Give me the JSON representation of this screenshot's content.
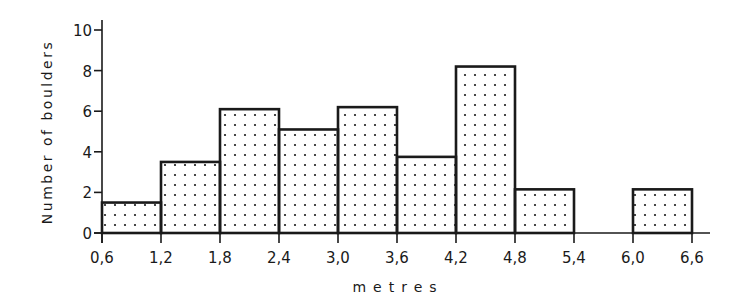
{
  "chart_data": {
    "type": "bar",
    "subtype": "histogram",
    "title": "",
    "xlabel": "metres",
    "ylabel": "Number of boulders",
    "bin_edges": [
      0.6,
      1.2,
      1.8,
      2.4,
      3.0,
      3.6,
      4.2,
      4.8,
      5.4,
      6.0,
      6.6
    ],
    "categories": [
      "0,6–1,2",
      "1,2–1,8",
      "1,8–2,4",
      "2,4–3,0",
      "3,0–3,6",
      "3,6–4,2",
      "4,2–4,8",
      "4,8–5,4",
      "5,4–6,0",
      "6,0–6,6"
    ],
    "values": [
      1.5,
      3.5,
      6.1,
      5.1,
      6.2,
      3.75,
      8.2,
      2.15,
      0,
      2.15
    ],
    "x_tick_labels": [
      "0,6",
      "1,2",
      "1,8",
      "2,4",
      "3,0",
      "3,6",
      "4,2",
      "4,8",
      "5,4",
      "6,0",
      "6,6"
    ],
    "y_ticks": [
      0,
      2,
      4,
      6,
      8,
      10
    ],
    "y_tick_labels": [
      "0",
      "2",
      "4",
      "6",
      "8",
      "10"
    ],
    "ylim": [
      0,
      10
    ],
    "xlim": [
      0.6,
      6.6
    ],
    "grid": false,
    "legend": null,
    "fill_pattern": "dotted",
    "colors": {
      "ink": "#1a1a1a",
      "background": "#ffffff"
    }
  }
}
